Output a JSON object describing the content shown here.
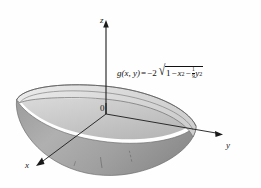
{
  "figure": {
    "type": "3d-surface-plot",
    "background_color": "#fefefe",
    "line_color": "#1a1a1a"
  },
  "axes": {
    "z_label": "z",
    "y_label": "y",
    "x_label": "x",
    "origin_label": "0"
  },
  "formula": {
    "function_name": "g",
    "args": "(x, y)",
    "equals": "=",
    "coefficient": "−2",
    "radical": "√",
    "term_one": "1",
    "minus_one": "−",
    "term_two_base": "x",
    "term_two_exp": "2",
    "minus_two": "−",
    "fraction_numerator": "1",
    "fraction_denominator": "9",
    "term_three_base": "y",
    "term_three_exp": "2",
    "plain_text": "g(x, y) = −2√(1 − x² − (1/9)y²)"
  },
  "surface": {
    "rim_fill": "#e2e2e2",
    "outer_fill": "#a8a8a8",
    "inner_fill": "#c4c4c4",
    "edge_color": "#6d6d6d",
    "gridline_color": "#6a6a6a"
  }
}
